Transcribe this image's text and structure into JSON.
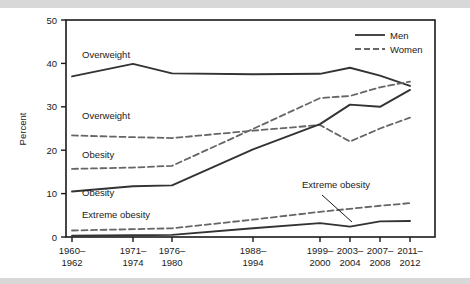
{
  "figure": {
    "background_color": "#ffffff",
    "band_color": "#d8d8d8"
  },
  "legend": {
    "position": "top-right",
    "entries": [
      {
        "label": "Men",
        "style": "solid",
        "color": "#333333"
      },
      {
        "label": "Women",
        "style": "dashed",
        "color": "#666666"
      }
    ]
  },
  "annotations": [
    {
      "id": "men-overweight",
      "text": "Overweight",
      "x": 82,
      "y": 58
    },
    {
      "id": "women-overweight",
      "text": "Overweight",
      "x": 82,
      "y": 119
    },
    {
      "id": "women-obesity",
      "text": "Obesity",
      "x": 82,
      "y": 158
    },
    {
      "id": "men-obesity",
      "text": "Obesity",
      "x": 82,
      "y": 196
    },
    {
      "id": "extreme-obesity-left",
      "text": "Extreme obesity",
      "x": 82,
      "y": 218
    },
    {
      "id": "extreme-obesity-callout",
      "text": "Extreme obesity",
      "x": 302,
      "y": 188
    }
  ],
  "chart_data": {
    "type": "line",
    "title": "",
    "xlabel": "",
    "ylabel": "Percent",
    "ylim": [
      0,
      50
    ],
    "yticks": [
      0,
      10,
      20,
      30,
      40,
      50
    ],
    "grid": false,
    "legend_position": "top-right",
    "categories": [
      "1960–1962",
      "1971–1974",
      "1976–1980",
      "1988–1994",
      "1999–2000",
      "2003–2004",
      "2007–2008",
      "2011–2012"
    ],
    "x_positions": [
      72,
      133,
      172,
      253,
      320,
      350,
      380,
      410
    ],
    "series": [
      {
        "name": "Men, Overweight",
        "sex": "Men",
        "style": "solid",
        "values": [
          37.0,
          39.9,
          37.7,
          37.5,
          37.6,
          39.0,
          37.2,
          34.8
        ]
      },
      {
        "name": "Women, Overweight",
        "sex": "Women",
        "style": "dashed",
        "values": [
          23.4,
          23.0,
          22.8,
          24.5,
          25.8,
          22.0,
          25.0,
          27.5
        ]
      },
      {
        "name": "Women, Obesity",
        "sex": "Women",
        "style": "dashed",
        "values": [
          15.7,
          16.0,
          16.4,
          24.9,
          32.0,
          32.5,
          34.5,
          35.8
        ]
      },
      {
        "name": "Men, Obesity",
        "sex": "Men",
        "style": "solid",
        "values": [
          10.5,
          11.7,
          11.9,
          20.2,
          26.0,
          30.5,
          30.0,
          33.9
        ]
      },
      {
        "name": "Women, Extreme obesity",
        "sex": "Women",
        "style": "dashed",
        "values": [
          1.5,
          1.8,
          2.0,
          4.0,
          5.8,
          6.5,
          7.2,
          7.8
        ]
      },
      {
        "name": "Men, Extreme obesity",
        "sex": "Men",
        "style": "solid",
        "values": [
          0.3,
          0.4,
          0.5,
          2.0,
          3.2,
          2.4,
          3.6,
          3.7
        ]
      }
    ]
  }
}
